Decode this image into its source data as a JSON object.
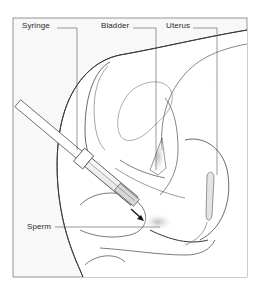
{
  "diagram": {
    "title": "",
    "labels": {
      "syringe": "Syringe",
      "bladder": "Bladder",
      "uterus": "Uterus",
      "sperm": "Sperm"
    },
    "colors": {
      "background": "#ffffff",
      "frame_fill": "#f7f7f7",
      "line": "#3a3a3a",
      "shade": "#cfcfcf"
    },
    "arrow": "direction-of-injection"
  }
}
